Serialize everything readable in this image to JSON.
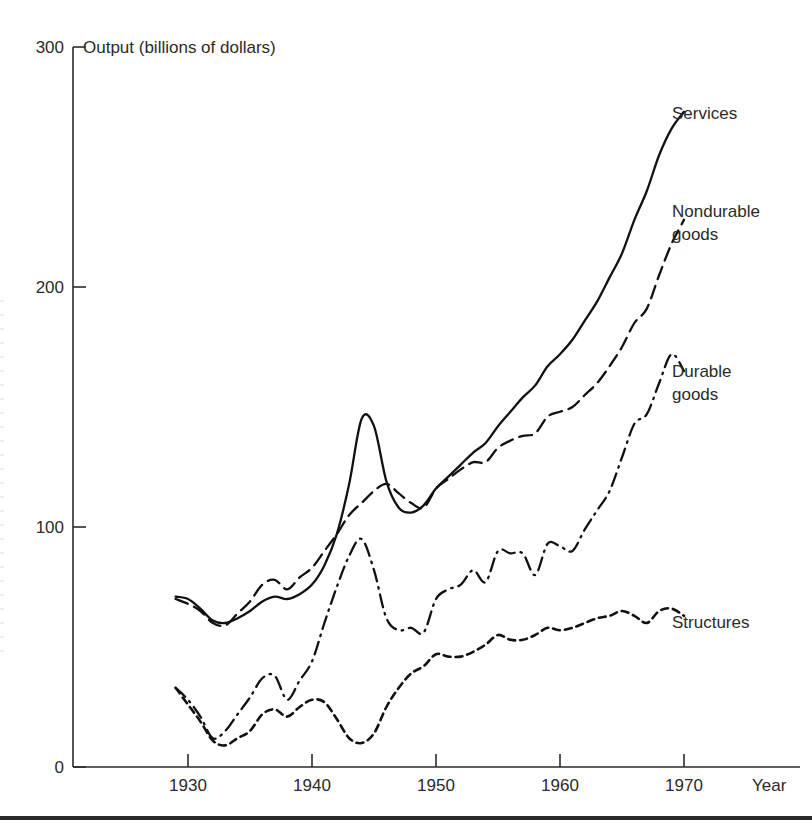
{
  "chart_data": {
    "type": "line",
    "title": "",
    "ylabel": "Output (billions of dollars)",
    "xlabel": "Year",
    "xlim": [
      1928,
      1973
    ],
    "ylim": [
      0,
      300
    ],
    "yticks": [
      0,
      100,
      200,
      300
    ],
    "xticks": [
      1930,
      1940,
      1950,
      1960,
      1970
    ],
    "grid": false,
    "legend_position": "right-inline-labels",
    "series": [
      {
        "name": "Services",
        "line_style": "solid",
        "label": "Services",
        "x": [
          1929,
          1930,
          1931,
          1932,
          1933,
          1934,
          1935,
          1936,
          1937,
          1938,
          1939,
          1940,
          1941,
          1942,
          1943,
          1944,
          1945,
          1946,
          1947,
          1948,
          1949,
          1950,
          1951,
          1952,
          1953,
          1954,
          1955,
          1956,
          1957,
          1958,
          1959,
          1960,
          1961,
          1962,
          1963,
          1964,
          1965,
          1966,
          1967,
          1968,
          1969,
          1970
        ],
        "y": [
          71,
          70,
          66,
          61,
          60,
          62,
          65,
          69,
          71,
          70,
          72,
          76,
          84,
          97,
          118,
          145,
          142,
          119,
          108,
          106,
          109,
          116,
          121,
          126,
          131,
          135,
          142,
          148,
          154,
          159,
          167,
          172,
          178,
          186,
          194,
          204,
          214,
          228,
          240,
          255,
          266,
          273
        ]
      },
      {
        "name": "Nondurable goods",
        "line_style": "dashed",
        "label": "Nondurable\ngoods",
        "x": [
          1929,
          1930,
          1931,
          1932,
          1933,
          1934,
          1935,
          1936,
          1937,
          1938,
          1939,
          1940,
          1941,
          1942,
          1943,
          1944,
          1945,
          1946,
          1947,
          1948,
          1949,
          1950,
          1951,
          1952,
          1953,
          1954,
          1955,
          1956,
          1957,
          1958,
          1959,
          1960,
          1961,
          1962,
          1963,
          1964,
          1965,
          1966,
          1967,
          1968,
          1969,
          1970
        ],
        "y": [
          70,
          68,
          65,
          60,
          59,
          64,
          69,
          76,
          78,
          74,
          79,
          83,
          90,
          97,
          105,
          110,
          115,
          118,
          114,
          110,
          108,
          116,
          120,
          124,
          127,
          127,
          133,
          136,
          138,
          139,
          146,
          148,
          150,
          155,
          160,
          167,
          175,
          185,
          191,
          205,
          218,
          228
        ]
      },
      {
        "name": "Durable goods",
        "line_style": "dash-dot",
        "label": "Durable\ngoods",
        "x": [
          1929,
          1930,
          1931,
          1932,
          1933,
          1934,
          1935,
          1936,
          1937,
          1938,
          1939,
          1940,
          1941,
          1942,
          1943,
          1944,
          1945,
          1946,
          1947,
          1948,
          1949,
          1950,
          1951,
          1952,
          1953,
          1954,
          1955,
          1956,
          1957,
          1958,
          1959,
          1960,
          1961,
          1962,
          1963,
          1964,
          1965,
          1966,
          1967,
          1968,
          1969,
          1970
        ],
        "y": [
          33,
          28,
          21,
          12,
          15,
          22,
          29,
          37,
          38,
          28,
          36,
          44,
          60,
          75,
          88,
          95,
          82,
          62,
          57,
          58,
          56,
          70,
          74,
          76,
          82,
          77,
          90,
          89,
          89,
          80,
          93,
          92,
          90,
          99,
          107,
          115,
          129,
          143,
          147,
          160,
          172,
          165
        ]
      },
      {
        "name": "Structures",
        "line_style": "dotted",
        "label": "Structures",
        "x": [
          1929,
          1930,
          1931,
          1932,
          1933,
          1934,
          1935,
          1936,
          1937,
          1938,
          1939,
          1940,
          1941,
          1942,
          1943,
          1944,
          1945,
          1946,
          1947,
          1948,
          1949,
          1950,
          1951,
          1952,
          1953,
          1954,
          1955,
          1956,
          1957,
          1958,
          1959,
          1960,
          1961,
          1962,
          1963,
          1964,
          1965,
          1966,
          1967,
          1968,
          1969,
          1970
        ],
        "y": [
          33,
          26,
          19,
          11,
          9,
          12,
          15,
          22,
          24,
          21,
          25,
          28,
          27,
          20,
          12,
          10,
          14,
          25,
          33,
          39,
          42,
          47,
          46,
          46,
          48,
          51,
          55,
          53,
          53,
          55,
          58,
          57,
          58,
          60,
          62,
          63,
          65,
          63,
          60,
          65,
          66,
          63
        ]
      }
    ]
  },
  "axis": {
    "y_title": "Output (billions of dollars)",
    "x_title": "Year",
    "y_tick_labels": [
      "300",
      "200",
      "100",
      "0"
    ],
    "x_tick_labels": [
      "1930",
      "1940",
      "1950",
      "1960",
      "1970"
    ]
  },
  "labels": {
    "services": "Services",
    "nondurable_line1": "Nondurable",
    "nondurable_line2": "goods",
    "durable_line1": "Durable",
    "durable_line2": "goods",
    "structures": "Structures"
  },
  "colors": {
    "ink": "#111111",
    "axis": "#2b2b2b",
    "background": "#ffffff"
  }
}
